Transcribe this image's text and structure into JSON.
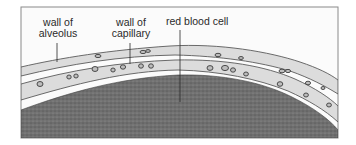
{
  "figure": {
    "labels": {
      "alveolus_wall": {
        "line1": "wall of",
        "line2": "alveolus"
      },
      "capillary_wall": {
        "line1": "wall of",
        "line2": "capillary"
      },
      "red_blood_cell": {
        "text": "red blood cell"
      }
    },
    "colors": {
      "frame": "#8a8a8a",
      "background": "#fbfbfb",
      "wall_fill": "#dcdcdc",
      "wall_outline": "#5a5a5a",
      "tissue": "#6f6f6f",
      "cell_fill": "#bdbdbd",
      "label_text": "#2a2a2a"
    },
    "structures": [
      "alveolus wall",
      "capillary wall",
      "red blood cells",
      "tissue"
    ]
  }
}
